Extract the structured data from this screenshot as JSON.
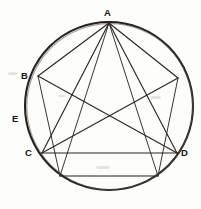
{
  "figure": {
    "background_color": "#fdfdfc",
    "ink_color": "#26211e",
    "canvas": {
      "width": 201,
      "height": 209
    }
  },
  "circle": {
    "center_x": 109,
    "center_y": 106,
    "radius": 84,
    "stroke_width": 2.1
  },
  "points": [
    {
      "id": "A",
      "label": "A",
      "x": 109,
      "y": 22,
      "label_x": 104,
      "label_y": 8
    },
    {
      "id": "B",
      "label": "B",
      "x": 37,
      "y": 76,
      "label_x": 21,
      "label_y": 72
    },
    {
      "id": "E",
      "label": "E",
      "x": 26,
      "y": 119,
      "label_x": 12,
      "label_y": 114
    },
    {
      "id": "C",
      "label": "C",
      "x": 41,
      "y": 153,
      "label_x": 25,
      "label_y": 148
    },
    {
      "id": "D",
      "label": "D",
      "x": 177,
      "y": 153,
      "label_x": 181,
      "label_y": 148
    },
    {
      "id": "F",
      "label": "",
      "x": 178,
      "y": 78,
      "label_x": 0,
      "label_y": 0
    }
  ],
  "segments": [
    {
      "name": "A-B",
      "x1": 109,
      "y1": 23,
      "x2": 38,
      "y2": 76
    },
    {
      "name": "A-F-right",
      "x1": 109,
      "y1": 23,
      "x2": 178,
      "y2": 78
    },
    {
      "name": "A-C",
      "x1": 109,
      "y1": 23,
      "x2": 42,
      "y2": 153
    },
    {
      "name": "A-D",
      "x1": 109,
      "y1": 23,
      "x2": 177,
      "y2": 153
    },
    {
      "name": "A-lower-left-chord-end",
      "x1": 109,
      "y1": 23,
      "x2": 60,
      "y2": 176
    },
    {
      "name": "A-lower-right-chord-end",
      "x1": 109,
      "y1": 23,
      "x2": 158,
      "y2": 176
    },
    {
      "name": "B-lower-left",
      "x1": 38,
      "y1": 76,
      "x2": 60,
      "y2": 176
    },
    {
      "name": "B-D",
      "x1": 38,
      "y1": 76,
      "x2": 177,
      "y2": 153
    },
    {
      "name": "F-C",
      "x1": 178,
      "y1": 78,
      "x2": 42,
      "y2": 153
    },
    {
      "name": "F-lower-right",
      "x1": 178,
      "y1": 78,
      "x2": 158,
      "y2": 176
    },
    {
      "name": "chord-C-D",
      "x1": 41,
      "y1": 153,
      "x2": 178,
      "y2": 153
    },
    {
      "name": "chord-lower",
      "x1": 60,
      "y1": 176,
      "x2": 158,
      "y2": 176
    }
  ],
  "labels": {
    "A": "A",
    "B": "B",
    "C": "C",
    "D": "D",
    "E": "E"
  }
}
